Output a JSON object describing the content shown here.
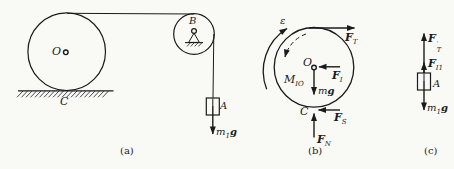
{
  "colors": {
    "ink": "#1b1b1b",
    "background": "#f9f9f6"
  },
  "fig_a": {
    "caption": "(a)",
    "labels": {
      "O": "O",
      "B": "B",
      "C": "C",
      "A": "A",
      "m1g": {
        "m": "m",
        "sub": "1",
        "g": "g"
      }
    }
  },
  "fig_b": {
    "caption": "(b)",
    "labels": {
      "epsilon": "ε",
      "F_T": {
        "base": "F",
        "sub": "T"
      },
      "O": "O",
      "F_I": {
        "base": "F",
        "sub": "I"
      },
      "M_IO": {
        "base": "M",
        "sub": "IO"
      },
      "mg": {
        "m": "m",
        "g": "g"
      },
      "C": "C",
      "F_S": {
        "base": "F",
        "sub": "S"
      },
      "F_N": {
        "base": "F",
        "sub": "N"
      }
    }
  },
  "fig_c": {
    "caption": "(c)",
    "labels": {
      "F_T_prime": {
        "base": "F",
        "prime": "′",
        "sub": "T"
      },
      "F_I1": {
        "base": "F",
        "sub": "I1"
      },
      "A": "A",
      "m1g": {
        "m": "m",
        "sub": "1",
        "g": "g"
      }
    }
  }
}
